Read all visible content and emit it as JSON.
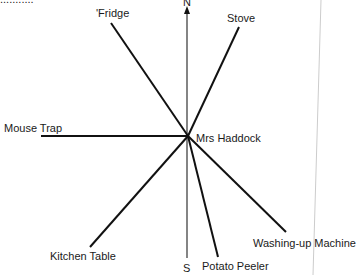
{
  "diagram": {
    "clipped_top_text": "...........",
    "center_label": "Mrs Haddock",
    "compass": {
      "north": "N",
      "south": "S"
    },
    "items": [
      {
        "label": "'Fridge",
        "x": 111,
        "y": 23
      },
      {
        "label": "Stove",
        "x": 239,
        "y": 27
      },
      {
        "label": "Mouse Trap",
        "x": 41,
        "y": 136
      },
      {
        "label": "Kitchen Table",
        "x": 90,
        "y": 247
      },
      {
        "label": "Potato Peeler",
        "x": 218,
        "y": 257
      },
      {
        "label": "Washing-up Machine",
        "x": 286,
        "y": 232
      }
    ],
    "colors": {
      "line": "#111111",
      "axis": "#333333",
      "page_edge": "#cccccc"
    }
  }
}
